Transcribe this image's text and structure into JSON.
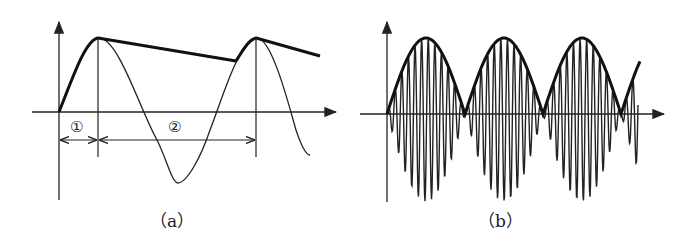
{
  "figure_a": {
    "caption": "（a）",
    "interval_labels": [
      "①",
      "②"
    ],
    "description": "Sine wave with thick envelope: rises to peak, then decays linearly until the sine wave catches up, forming a sawtooth-like peak detector output"
  },
  "figure_b": {
    "caption": "（b）",
    "description": "High-frequency carrier modulated by a rectified sine envelope (thick line) showing three full arches"
  },
  "colors": {
    "ink": "#222222",
    "background": "#ffffff"
  }
}
